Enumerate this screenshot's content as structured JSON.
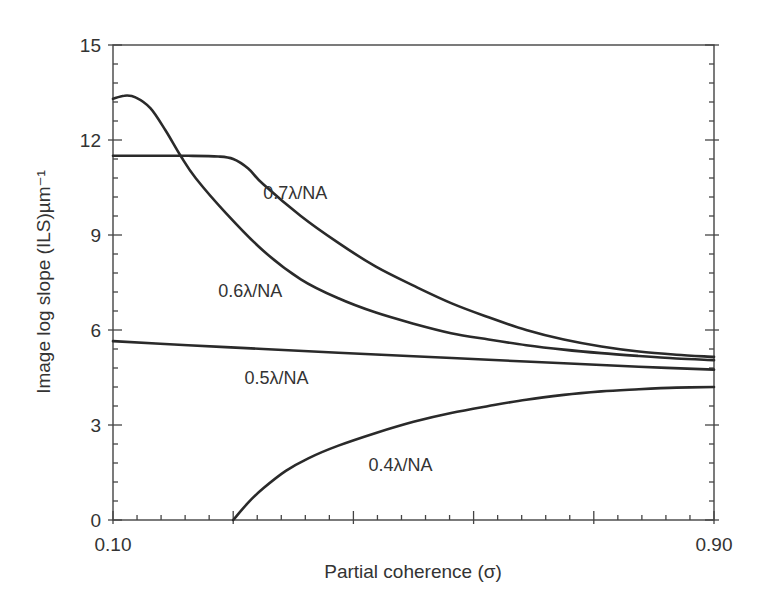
{
  "chart_data": {
    "type": "line",
    "title": "",
    "xlabel": "Partial coherence (σ)",
    "ylabel": "Image log slope (ILS)µm⁻¹",
    "xlim": [
      0.1,
      0.9
    ],
    "ylim": [
      0,
      15
    ],
    "x_tick_labels": [
      "0.10",
      "0.90"
    ],
    "x_major_ticks": [
      0.1,
      0.26,
      0.42,
      0.58,
      0.74,
      0.9
    ],
    "y_tick_labels": [
      "0",
      "3",
      "6",
      "9",
      "12",
      "15"
    ],
    "y_ticks": [
      0,
      3,
      6,
      9,
      12,
      15
    ],
    "grid": false,
    "legend": "inline curve labels",
    "series": [
      {
        "name": "0.7λ/NA",
        "label_pos": [
          0.3,
          10.15
        ],
        "x": [
          0.1,
          0.15,
          0.2,
          0.24,
          0.26,
          0.28,
          0.3,
          0.35,
          0.4,
          0.45,
          0.5,
          0.55,
          0.6,
          0.65,
          0.7,
          0.75,
          0.8,
          0.85,
          0.9
        ],
        "values": [
          11.5,
          11.5,
          11.5,
          11.48,
          11.4,
          11.1,
          10.6,
          9.6,
          8.75,
          8.0,
          7.4,
          6.85,
          6.4,
          6.0,
          5.7,
          5.48,
          5.32,
          5.22,
          5.15
        ]
      },
      {
        "name": "0.6λ/NA",
        "label_pos": [
          0.24,
          7.05
        ],
        "x": [
          0.1,
          0.115,
          0.13,
          0.15,
          0.17,
          0.19,
          0.21,
          0.25,
          0.3,
          0.35,
          0.4,
          0.45,
          0.5,
          0.55,
          0.6,
          0.65,
          0.7,
          0.75,
          0.8,
          0.85,
          0.9
        ],
        "values": [
          13.3,
          13.4,
          13.35,
          13.0,
          12.3,
          11.5,
          10.8,
          9.7,
          8.5,
          7.6,
          7.0,
          6.55,
          6.2,
          5.9,
          5.7,
          5.52,
          5.38,
          5.27,
          5.18,
          5.1,
          5.05
        ]
      },
      {
        "name": "0.5λ/NA",
        "label_pos": [
          0.275,
          4.3
        ],
        "x": [
          0.1,
          0.2,
          0.3,
          0.4,
          0.5,
          0.6,
          0.7,
          0.8,
          0.9
        ],
        "values": [
          5.65,
          5.52,
          5.4,
          5.28,
          5.17,
          5.06,
          4.95,
          4.84,
          4.75
        ]
      },
      {
        "name": "0.4λ/NA",
        "label_pos": [
          0.44,
          1.55
        ],
        "x": [
          0.26,
          0.28,
          0.3,
          0.33,
          0.36,
          0.4,
          0.45,
          0.5,
          0.55,
          0.6,
          0.65,
          0.7,
          0.75,
          0.8,
          0.85,
          0.9
        ],
        "values": [
          0.0,
          0.55,
          1.0,
          1.55,
          1.95,
          2.35,
          2.75,
          3.1,
          3.38,
          3.6,
          3.8,
          3.95,
          4.06,
          4.13,
          4.18,
          4.2
        ]
      }
    ]
  }
}
